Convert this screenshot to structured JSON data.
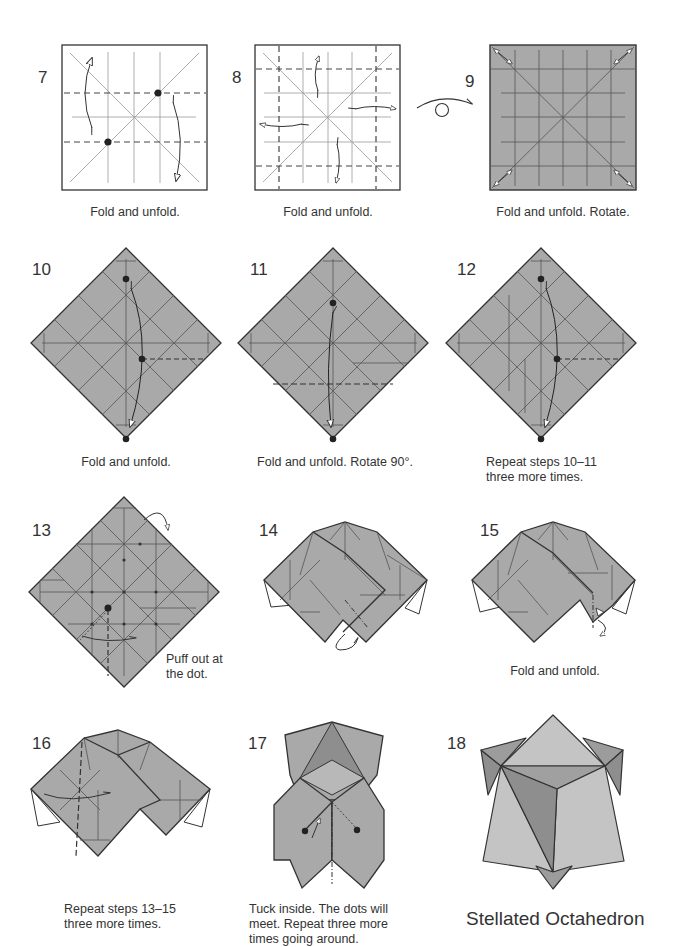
{
  "document": {
    "title": "Stellated Octahedron",
    "colors": {
      "paper_gray": "#a9a9a9",
      "paper_light": "#c4c4c4",
      "paper_dark": "#8e8e8e",
      "line": "#3a3a3a",
      "white": "#ffffff"
    }
  },
  "steps": [
    {
      "number": "7",
      "caption": "Fold and unfold."
    },
    {
      "number": "8",
      "caption": "Fold and unfold."
    },
    {
      "number": "9",
      "caption": "Fold and unfold. Rotate."
    },
    {
      "number": "10",
      "caption": "Fold and unfold."
    },
    {
      "number": "11",
      "caption": "Fold and unfold. Rotate 90°."
    },
    {
      "number": "12",
      "caption_line1": "Repeat steps 10–11",
      "caption_line2": "three more times."
    },
    {
      "number": "13",
      "caption_line1": "Puff out at",
      "caption_line2": "the dot."
    },
    {
      "number": "14",
      "caption": ""
    },
    {
      "number": "15",
      "caption": "Fold and unfold."
    },
    {
      "number": "16",
      "caption_line1": "Repeat steps 13–15",
      "caption_line2": "three more times."
    },
    {
      "number": "17",
      "caption_line1": "Tuck inside. The dots will",
      "caption_line2": "meet. Repeat three more",
      "caption_line3": "times going around."
    },
    {
      "number": "18",
      "caption": "Stellated Octahedron"
    }
  ],
  "icons": {
    "turn_over": "turn-over-icon"
  }
}
